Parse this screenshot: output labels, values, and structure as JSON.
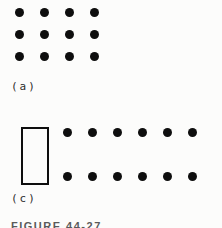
{
  "page": {
    "paper_color": "#fcfcfb",
    "ink_color": "#0e0e0e"
  },
  "figure": {
    "caption": "FIGURE 44-27",
    "parts": [
      {
        "id": "a",
        "label": "(a)",
        "grid": {
          "rows": 3,
          "cols": 4,
          "dot_count": 12
        }
      },
      {
        "id": "c",
        "label": "(c)",
        "has_rectangle": true,
        "grid": {
          "rows": 2,
          "cols": 6,
          "dot_count": 12
        }
      }
    ]
  }
}
